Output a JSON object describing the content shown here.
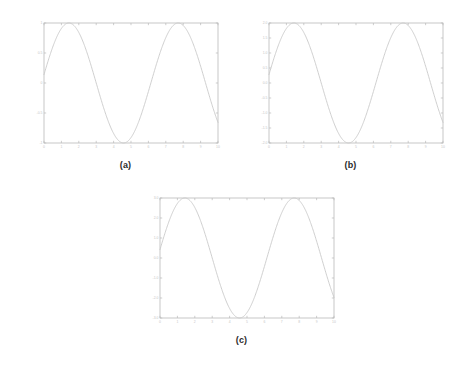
{
  "figure": {
    "background_color": "#ffffff",
    "curve_color": "#c9c9c9",
    "axis_color": "#b9b9b9",
    "caption_color": "#2b2b2b",
    "panels": [
      {
        "id": "a",
        "caption": "(a)",
        "x_tick_labels": [
          "0",
          "1",
          "2",
          "3",
          "4",
          "5",
          "6",
          "7",
          "8",
          "9",
          "10"
        ],
        "y_tick_labels": [
          "1",
          "0.5",
          "0",
          "-0.5",
          "-1"
        ]
      },
      {
        "id": "b",
        "caption": "(b)",
        "x_tick_labels": [
          "0",
          "1",
          "2",
          "3",
          "4",
          "5",
          "6",
          "7",
          "8",
          "9",
          "10"
        ],
        "y_tick_labels": [
          "2.0",
          "1.5",
          "1.0",
          "0.5",
          "0.0",
          "-0.5",
          "-1.0",
          "-1.5",
          "-2.0"
        ]
      },
      {
        "id": "c",
        "caption": "(c)",
        "x_tick_labels": [
          "0",
          "1",
          "2",
          "3",
          "4",
          "5",
          "6",
          "7",
          "8",
          "9",
          "10"
        ],
        "y_tick_labels": [
          "3.0",
          "2.0",
          "1.0",
          "0.0",
          "-1.0",
          "-2.0",
          "-3.0"
        ]
      }
    ]
  },
  "chart_data": [
    {
      "type": "line",
      "panel": "a",
      "title": "(a)",
      "xlabel": "",
      "ylabel": "",
      "xlim": [
        0,
        10
      ],
      "ylim": [
        -1,
        1
      ],
      "grid": false,
      "legend": "none",
      "xticks": [
        0,
        1,
        2,
        3,
        4,
        5,
        6,
        7,
        8,
        9,
        10
      ],
      "yticks": [
        1,
        0.5,
        0,
        -0.5,
        -1
      ],
      "series": [
        {
          "name": "sin",
          "amplitude": 1,
          "x": [
            0,
            0.25,
            0.5,
            0.75,
            1,
            1.25,
            1.5,
            1.75,
            2,
            2.25,
            2.5,
            2.75,
            3,
            3.25,
            3.5,
            3.75,
            4,
            4.25,
            4.5,
            4.75,
            5,
            5.25,
            5.5,
            5.75,
            6,
            6.25,
            6.5,
            6.75,
            7,
            7.25,
            7.5,
            7.75,
            8,
            8.25,
            8.5,
            8.75,
            9,
            9.25,
            9.5,
            9.75,
            10
          ],
          "values": [
            0.14,
            0.38,
            0.59,
            0.77,
            0.9,
            0.98,
            1.0,
            0.97,
            0.88,
            0.73,
            0.54,
            0.32,
            0.08,
            -0.17,
            -0.41,
            -0.62,
            -0.79,
            -0.92,
            -0.99,
            -1.0,
            -0.96,
            -0.86,
            -0.7,
            -0.5,
            -0.28,
            -0.03,
            0.22,
            0.45,
            0.65,
            0.81,
            0.93,
            0.99,
            1.0,
            0.95,
            0.84,
            0.67,
            0.47,
            0.24,
            -0.01,
            -0.26,
            -0.49
          ]
        }
      ]
    },
    {
      "type": "line",
      "panel": "b",
      "title": "(b)",
      "xlabel": "",
      "ylabel": "",
      "xlim": [
        0,
        10
      ],
      "ylim": [
        -2,
        2
      ],
      "grid": false,
      "legend": "none",
      "xticks": [
        0,
        1,
        2,
        3,
        4,
        5,
        6,
        7,
        8,
        9,
        10
      ],
      "yticks": [
        2.0,
        1.5,
        1.0,
        0.5,
        0.0,
        -0.5,
        -1.0,
        -1.5,
        -2.0
      ],
      "series": [
        {
          "name": "2*sin",
          "amplitude": 2,
          "x": [
            0,
            0.25,
            0.5,
            0.75,
            1,
            1.25,
            1.5,
            1.75,
            2,
            2.25,
            2.5,
            2.75,
            3,
            3.25,
            3.5,
            3.75,
            4,
            4.25,
            4.5,
            4.75,
            5,
            5.25,
            5.5,
            5.75,
            6,
            6.25,
            6.5,
            6.75,
            7,
            7.25,
            7.5,
            7.75,
            8,
            8.25,
            8.5,
            8.75,
            9,
            9.25,
            9.5,
            9.75,
            10
          ],
          "values": [
            0.28,
            0.76,
            1.18,
            1.54,
            1.8,
            1.96,
            2.0,
            1.94,
            1.76,
            1.46,
            1.08,
            0.64,
            0.16,
            -0.34,
            -0.82,
            -1.24,
            -1.58,
            -1.84,
            -1.98,
            -2.0,
            -1.92,
            -1.72,
            -1.4,
            -1.0,
            -0.56,
            -0.06,
            0.44,
            0.9,
            1.3,
            1.62,
            1.86,
            1.98,
            2.0,
            1.9,
            1.68,
            1.34,
            0.94,
            0.48,
            -0.02,
            -0.52,
            -0.98
          ]
        }
      ]
    },
    {
      "type": "line",
      "panel": "c",
      "title": "(c)",
      "xlabel": "",
      "ylabel": "",
      "xlim": [
        0,
        10
      ],
      "ylim": [
        -3,
        3
      ],
      "grid": false,
      "legend": "none",
      "xticks": [
        0,
        1,
        2,
        3,
        4,
        5,
        6,
        7,
        8,
        9,
        10
      ],
      "yticks": [
        3.0,
        2.0,
        1.0,
        0.0,
        -1.0,
        -2.0,
        -3.0
      ],
      "series": [
        {
          "name": "3*sin",
          "amplitude": 3,
          "x": [
            0,
            0.25,
            0.5,
            0.75,
            1,
            1.25,
            1.5,
            1.75,
            2,
            2.25,
            2.5,
            2.75,
            3,
            3.25,
            3.5,
            3.75,
            4,
            4.25,
            4.5,
            4.75,
            5,
            5.25,
            5.5,
            5.75,
            6,
            6.25,
            6.5,
            6.75,
            7,
            7.25,
            7.5,
            7.75,
            8,
            8.25,
            8.5,
            8.75,
            9,
            9.25,
            9.5,
            9.75,
            10
          ],
          "values": [
            0.42,
            1.14,
            1.77,
            2.31,
            2.7,
            2.94,
            3.0,
            2.91,
            2.64,
            2.19,
            1.62,
            0.96,
            0.24,
            -0.51,
            -1.23,
            -1.86,
            -2.37,
            -2.76,
            -2.97,
            -3.0,
            -2.88,
            -2.58,
            -2.1,
            -1.5,
            -0.84,
            -0.09,
            0.66,
            1.35,
            1.95,
            2.43,
            2.79,
            2.97,
            3.0,
            2.85,
            2.52,
            2.01,
            1.41,
            0.72,
            -0.03,
            -0.78,
            -1.47
          ]
        }
      ]
    }
  ]
}
